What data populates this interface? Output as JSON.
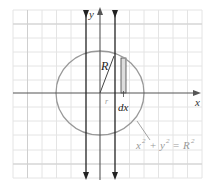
{
  "diagram": {
    "type": "coordinate-plane-circle",
    "axes": {
      "x_label": "x",
      "y_label": "y"
    },
    "labels": {
      "radius": "R",
      "small_r": "r",
      "strip_width": "dx",
      "equation_x": "x",
      "equation_plus": "+",
      "equation_y": "y",
      "equation_eq": "=",
      "equation_R": "R",
      "equation_exp": "2"
    },
    "equation": "x² + y² = R²",
    "colors": {
      "grid_minor": "#e4e4e4",
      "grid_major": "#cfcfcf",
      "axis": "#555555",
      "arrow_lines": "#222222",
      "circle": "#999999",
      "strip_fill": "#dddddd",
      "equation_text": "#9a9a9a"
    }
  }
}
